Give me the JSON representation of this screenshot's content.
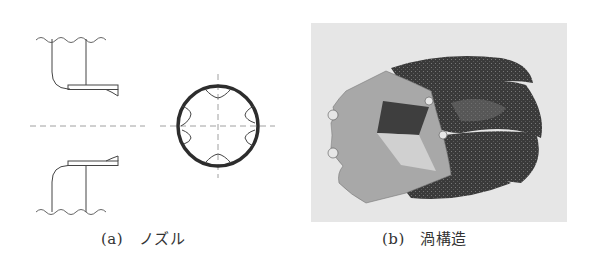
{
  "figure": {
    "panels": [
      {
        "id": "a",
        "label": "(a)",
        "title": "ノズル",
        "caption": "(a)　ノズル",
        "views": [
          "nozzle-cross-section",
          "nozzle-front-view"
        ]
      },
      {
        "id": "b",
        "label": "(b)",
        "title": "渦構造",
        "caption": "(b)　渦構造",
        "views": [
          "vortex-structure-render"
        ]
      }
    ],
    "colors": {
      "line": "#444444",
      "centerline": "#888888",
      "ring": "#333333",
      "render_background": "#e6e6e6",
      "render_face": "#a8a8a8",
      "render_dark": "#3a3a3a"
    }
  }
}
